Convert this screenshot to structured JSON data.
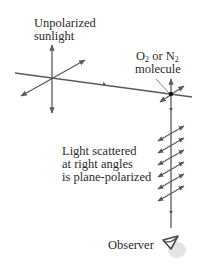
{
  "labels": {
    "sunlight_line1": "Unpolarized",
    "sunlight_line2": "sunlight",
    "molecule_o": "O",
    "molecule_sub1": "2",
    "molecule_or": " or N",
    "molecule_sub2": "2",
    "molecule_line2": "molecule",
    "scattered_line1": "Light scattered",
    "scattered_line2": "at right angles",
    "scattered_line3": "is plane-polarized",
    "observer": "Observer"
  },
  "colors": {
    "line": "#5a5a5a",
    "text": "#2a2a2a",
    "molecule": "#111111"
  }
}
